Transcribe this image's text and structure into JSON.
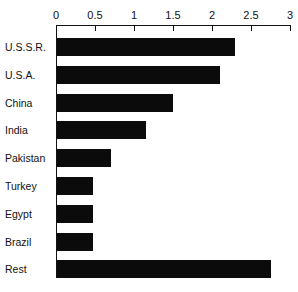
{
  "chart_data": {
    "type": "bar",
    "orientation": "horizontal",
    "title": "",
    "subtitle": "",
    "xlabel": "",
    "ylabel": "",
    "categories": [
      "U.S.S.R.",
      "U.S.A.",
      "China",
      "India",
      "Pakistan",
      "Turkey",
      "Egypt",
      "Brazil",
      "Rest"
    ],
    "values": [
      2.3,
      2.1,
      1.5,
      1.15,
      0.7,
      0.48,
      0.48,
      0.47,
      2.75
    ],
    "xlim": [
      0,
      3
    ],
    "xticks": [
      0,
      0.5,
      1,
      1.5,
      2,
      2.5,
      3
    ],
    "xtick_labels": [
      "0",
      "0.5",
      "1",
      "1.5",
      "2",
      "2.5",
      "3"
    ],
    "grid": false,
    "legend": null,
    "bar_color": "#0b0b0b",
    "axis_color": "#111111",
    "background": "#ffffff",
    "annotations": []
  },
  "axis": {
    "tick_labels": [
      "0",
      "0.5",
      "1",
      "1.5",
      "2",
      "2.5",
      "3"
    ]
  },
  "rows": [
    {
      "label": "U.S.S.R.",
      "value": 2.3
    },
    {
      "label": "U.S.A.",
      "value": 2.1
    },
    {
      "label": "China",
      "value": 1.5
    },
    {
      "label": "India",
      "value": 1.15
    },
    {
      "label": "Pakistan",
      "value": 0.7
    },
    {
      "label": "Turkey",
      "value": 0.48
    },
    {
      "label": "Egypt",
      "value": 0.48
    },
    {
      "label": "Brazil",
      "value": 0.47
    },
    {
      "label": "Rest",
      "value": 2.75
    }
  ]
}
